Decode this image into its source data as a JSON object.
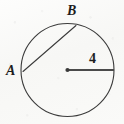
{
  "figure": {
    "background_color": "#fbfbfa",
    "stroke_color": "#3b3b3b",
    "labels": {
      "point_a": "A",
      "point_b": "B",
      "radius_value": "4"
    }
  },
  "chart_data": {
    "type": "diagram",
    "title": "",
    "shapes": [
      {
        "name": "circle",
        "kind": "circle",
        "center": [
          67.5,
          70
        ],
        "radius": 46.5,
        "stroke": "#3b3b3b",
        "stroke_width": 1.1,
        "fill": "none"
      },
      {
        "name": "center-point",
        "kind": "point",
        "position": [
          67.5,
          70
        ],
        "radius": 2.1,
        "fill": "#3b3b3b"
      },
      {
        "name": "radius-segment",
        "kind": "segment",
        "from": [
          67.5,
          70
        ],
        "to": [
          114,
          70
        ],
        "stroke": "#4a4a4a",
        "stroke_width": 1.9,
        "label": "4"
      },
      {
        "name": "chord-ab",
        "kind": "segment",
        "from": [
          23,
          71.5
        ],
        "to": [
          76,
          25.5
        ],
        "stroke": "#3b3b3b",
        "stroke_width": 1.1,
        "label": "AB"
      }
    ],
    "points": [
      {
        "name": "A",
        "label": "A",
        "on_circle": true,
        "position": [
          23,
          71.5
        ],
        "label_position": [
          6,
          64
        ]
      },
      {
        "name": "B",
        "label": "B",
        "on_circle": true,
        "position": [
          76,
          25.5
        ],
        "label_position": [
          67,
          4
        ]
      },
      {
        "name": "O",
        "label": "",
        "on_circle": false,
        "position": [
          67.5,
          70
        ],
        "label_position": [
          67.5,
          70
        ]
      }
    ],
    "annotations": [
      {
        "text": "4",
        "position": [
          93,
          60
        ],
        "refers_to": "radius-segment"
      },
      {
        "text": "B",
        "position": [
          72,
          12
        ],
        "refers_to": "point-b"
      },
      {
        "text": "A",
        "position": [
          11,
          73
        ],
        "refers_to": "point-a"
      }
    ],
    "xlim": [
      0,
      124
    ],
    "ylim": [
      0,
      124
    ],
    "grid": false,
    "legend": null
  }
}
